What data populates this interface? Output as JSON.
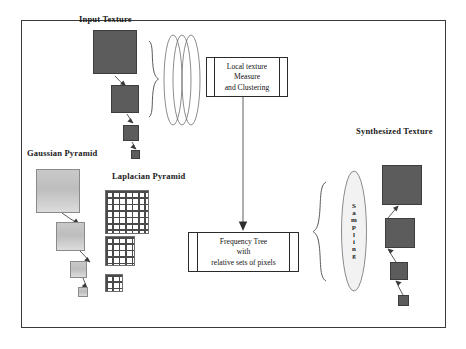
{
  "diagram": {
    "frame": {
      "x": 21,
      "y": 20,
      "width": 425,
      "height": 308
    },
    "colors": {
      "texture_fill": "#5c5c5c",
      "texture_border": "#3d3d3d",
      "gaussian_fill_top": "#c9c9c9",
      "gaussian_fill_bottom": "#dcdcdc",
      "gaussian_border": "#8a8a8a",
      "laplacian_grid": "#4a4a4a",
      "stroke": "#3a3a3a",
      "text": "#1a1a1a",
      "background": "#ffffff",
      "ellipse_fill": "#f2f2f2"
    }
  },
  "labels": {
    "input_texture": "Input Texture",
    "gaussian_pyramid": "Gaussian Pyramid",
    "laplacian_pyramid": "Laplacian Pyramid",
    "synthesized_texture": "Synthesized Texture"
  },
  "boxes": {
    "local_texture": {
      "name": "local-texture-measure-box",
      "lines": [
        "Local texture",
        "Measure",
        "and Clustering"
      ],
      "x": 206,
      "y": 57,
      "width": 82,
      "height": 40
    },
    "frequency_tree": {
      "name": "frequency-tree-box",
      "lines": [
        "Frequency Tree",
        "with",
        "relative sets of pixels"
      ],
      "x": 188,
      "y": 232,
      "width": 111,
      "height": 40
    }
  },
  "sampling": {
    "label": "Sampling",
    "letters": [
      "S",
      "a",
      "m",
      "p",
      "l",
      "i",
      "n",
      "g"
    ]
  },
  "pyramids": {
    "input_texture": {
      "name": "input-texture-pyramid",
      "levels": [
        {
          "x": 93,
          "y": 30,
          "size": 44
        },
        {
          "x": 111,
          "y": 85,
          "size": 28
        },
        {
          "x": 123,
          "y": 125,
          "size": 16
        },
        {
          "x": 131,
          "y": 150,
          "size": 9
        }
      ]
    },
    "gaussian": {
      "name": "gaussian-pyramid-levels",
      "levels": [
        {
          "x": 36,
          "y": 169,
          "size": 44
        },
        {
          "x": 56,
          "y": 222,
          "size": 29
        },
        {
          "x": 70,
          "y": 261,
          "size": 17
        },
        {
          "x": 78,
          "y": 287,
          "size": 10
        }
      ]
    },
    "laplacian": {
      "name": "laplacian-pyramid-levels",
      "levels": [
        {
          "x": 105,
          "y": 190,
          "size": 44
        },
        {
          "x": 105,
          "y": 236,
          "size": 30
        },
        {
          "x": 105,
          "y": 274,
          "size": 18
        }
      ]
    },
    "synthesized": {
      "name": "synthesized-texture-pyramid",
      "levels": [
        {
          "x": 382,
          "y": 165,
          "size": 40
        },
        {
          "x": 385,
          "y": 218,
          "size": 30
        },
        {
          "x": 390,
          "y": 262,
          "size": 18
        },
        {
          "x": 398,
          "y": 295,
          "size": 11
        }
      ]
    }
  },
  "connectors": {
    "measure_to_tree": {
      "name": "measure-to-frequency-tree-arrow",
      "direction": "down"
    },
    "input_to_measure": {
      "name": "input-texture-brace",
      "direction": "right"
    },
    "tree_to_sampling": {
      "name": "frequency-tree-brace",
      "direction": "left"
    }
  }
}
